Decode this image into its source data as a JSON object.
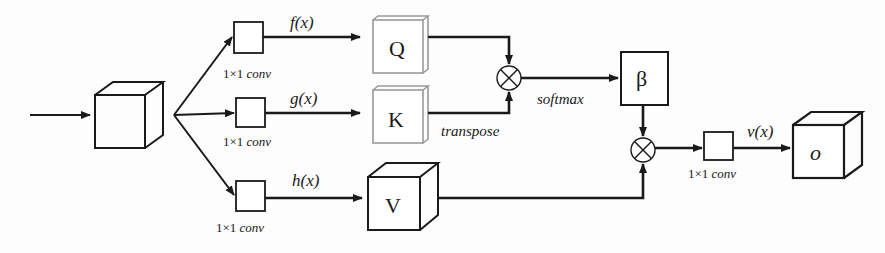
{
  "diagram": {
    "type": "self-attention-block",
    "nodes": {
      "input_cube": {
        "label": ""
      },
      "conv_f": {
        "label": "1×1",
        "label_italic": "conv"
      },
      "conv_g": {
        "label": "1×1",
        "label_italic": "conv"
      },
      "conv_h": {
        "label": "1×1",
        "label_italic": "conv"
      },
      "conv_v": {
        "label": "1×1",
        "label_italic": "conv"
      },
      "query": {
        "label": "Q"
      },
      "key": {
        "label": "K"
      },
      "value": {
        "label": "V"
      },
      "attention_map": {
        "label": "β"
      },
      "output_cube": {
        "label": "o"
      },
      "multiply_top": {
        "symbol": "⊗"
      },
      "multiply_bottom": {
        "symbol": "⊗"
      }
    },
    "edge_labels": {
      "f": "f(x)",
      "g": "g(x)",
      "h": "h(x)",
      "v": "v(x)",
      "softmax": "softmax",
      "transpose": "transpose"
    },
    "colors": {
      "stroke": "#1a1a1a",
      "qk_border": "#9a9a9a",
      "background": "#fdfdfd"
    }
  }
}
